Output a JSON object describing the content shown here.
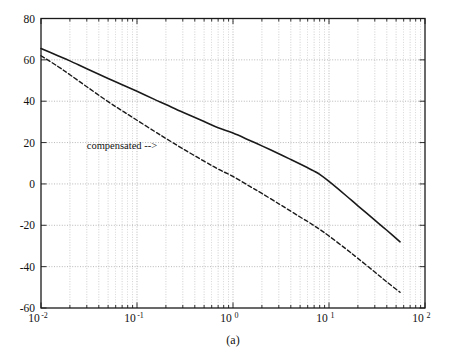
{
  "chart_data": {
    "type": "line",
    "title": "",
    "subtitle": "",
    "caption": "(a)",
    "xlabel": "",
    "ylabel": "",
    "xscale": "log",
    "yscale": "linear",
    "xlim": [
      0.01,
      100
    ],
    "ylim": [
      -60,
      80
    ],
    "grid": true,
    "grid_minor": true,
    "legend": "none",
    "xticks": [
      0.01,
      0.1,
      1,
      10,
      100
    ],
    "xtick_labels": [
      "10-2",
      "10-1",
      "100",
      "101",
      "102"
    ],
    "xtick_mantissas": [
      "10",
      "10",
      "10",
      "10",
      "10"
    ],
    "xtick_exponents": [
      "-2",
      "-1",
      "0",
      "1",
      "2"
    ],
    "yticks": [
      -60,
      -40,
      -20,
      0,
      20,
      40,
      60,
      80
    ],
    "ytick_labels": [
      "-60",
      "-40",
      "-20",
      "0",
      "20",
      "40",
      "60",
      "80"
    ],
    "annotations": [
      {
        "name": "compensated-annotation",
        "text": "compensated  -->",
        "x": 0.03,
        "y": 17
      }
    ],
    "series": [
      {
        "name": "uncompensated",
        "style": "solid",
        "color": "#1a1a1a",
        "linewidth": 1.6,
        "x": [
          0.01,
          0.015,
          0.02,
          0.03,
          0.05,
          0.07,
          0.1,
          0.15,
          0.2,
          0.3,
          0.5,
          0.7,
          1.0,
          1.5,
          2.0,
          3.0,
          4.0,
          5.0,
          6.0,
          7.0,
          8.0,
          10.0,
          15.0,
          20.0,
          30.0,
          40.0,
          55.0
        ],
        "y": [
          65.5,
          62.0,
          59.5,
          55.7,
          51.0,
          48.0,
          44.8,
          41.0,
          38.4,
          34.7,
          30.2,
          27.2,
          24.6,
          21.0,
          18.4,
          14.6,
          11.8,
          9.6,
          7.8,
          6.2,
          4.6,
          1.2,
          -5.6,
          -10.6,
          -17.5,
          -22.4,
          -28.0
        ]
      },
      {
        "name": "compensated",
        "style": "dashed",
        "color": "#1a1a1a",
        "linewidth": 1.4,
        "x": [
          0.01,
          0.015,
          0.02,
          0.03,
          0.05,
          0.07,
          0.1,
          0.15,
          0.2,
          0.3,
          0.5,
          0.7,
          1.0,
          1.5,
          2.0,
          3.0,
          4.0,
          5.0,
          6.0,
          7.0,
          8.0,
          10.0,
          15.0,
          20.0,
          30.0,
          40.0,
          55.0
        ],
        "y": [
          62.0,
          56.8,
          52.8,
          47.0,
          39.8,
          35.4,
          30.8,
          25.6,
          22.0,
          17.0,
          11.0,
          7.2,
          3.6,
          -1.2,
          -4.6,
          -9.6,
          -13.2,
          -16.0,
          -18.2,
          -20.2,
          -22.0,
          -25.2,
          -31.4,
          -36.0,
          -42.6,
          -47.4,
          -52.4
        ]
      }
    ]
  },
  "figure": {
    "background_color": "#ffffff",
    "axis_color": "#1a1a1a",
    "grid_color": "#9a9a9a",
    "text_color": "#111111"
  }
}
